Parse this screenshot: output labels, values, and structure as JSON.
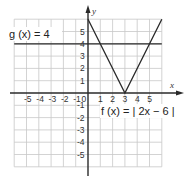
{
  "diagram": {
    "type": "coordinate-graph",
    "axes": {
      "x_label": "x",
      "y_label": "y",
      "x_ticks": [
        "-5",
        "-4",
        "-3",
        "-2",
        "-1",
        "0",
        "1",
        "2",
        "3",
        "4",
        "5"
      ],
      "y_ticks": [
        "5",
        "4",
        "3",
        "2",
        "1",
        "-1",
        "-2",
        "-3",
        "-4",
        "-5"
      ],
      "x_range": [
        -6,
        6
      ],
      "y_range": [
        -6,
        6
      ],
      "grid": true
    },
    "functions": [
      {
        "name": "g",
        "label": "g (x) = 4",
        "expression": "4",
        "type": "horizontal-line"
      },
      {
        "name": "f",
        "label": "f (x) = | 2x − 6 |",
        "expression": "|2x-6|",
        "type": "absolute-value",
        "vertex": [
          3,
          0
        ]
      }
    ]
  }
}
